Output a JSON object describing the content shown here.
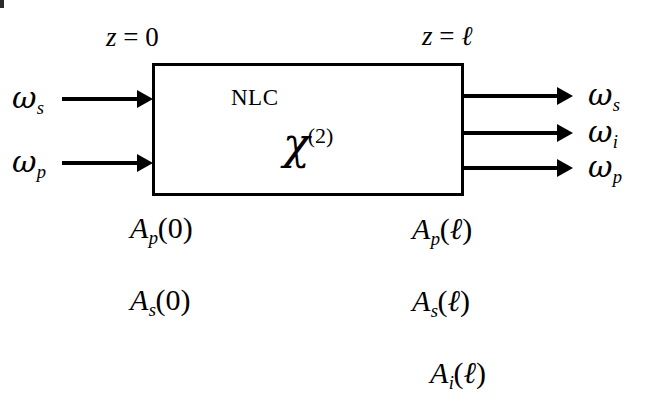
{
  "diagram": {
    "box": {
      "primary_label": "NLC",
      "susceptibility": {
        "symbol": "χ",
        "order": "(2)"
      }
    },
    "position_labels": {
      "input_plane": {
        "lhs": "z",
        "eq": "=",
        "rhs": "0",
        "full": "z = 0"
      },
      "output_plane": {
        "lhs": "z",
        "eq": "=",
        "rhs": "ℓ",
        "full": "z = ℓ"
      }
    },
    "inputs": [
      {
        "symbol": "ω",
        "subscript": "s",
        "full": "ωs"
      },
      {
        "symbol": "ω",
        "subscript": "p",
        "full": "ωp"
      }
    ],
    "outputs": [
      {
        "symbol": "ω",
        "subscript": "s",
        "full": "ωs"
      },
      {
        "symbol": "ω",
        "subscript": "i",
        "full": "ωi"
      },
      {
        "symbol": "ω",
        "subscript": "p",
        "full": "ωp"
      }
    ],
    "input_amplitudes": [
      {
        "symbol": "A",
        "subscript": "p",
        "argument": "0",
        "full": "Ap(0)"
      },
      {
        "symbol": "A",
        "subscript": "s",
        "argument": "0",
        "full": "As(0)"
      }
    ],
    "output_amplitudes": [
      {
        "symbol": "A",
        "subscript": "p",
        "argument": "ℓ",
        "full": "Ap(ℓ)"
      },
      {
        "symbol": "A",
        "subscript": "s",
        "argument": "ℓ",
        "full": "As(ℓ)"
      },
      {
        "symbol": "A",
        "subscript": "i",
        "argument": "ℓ",
        "full": "Ai(ℓ)"
      }
    ],
    "colors": {
      "ink": "#000000",
      "background": "#ffffff"
    }
  }
}
